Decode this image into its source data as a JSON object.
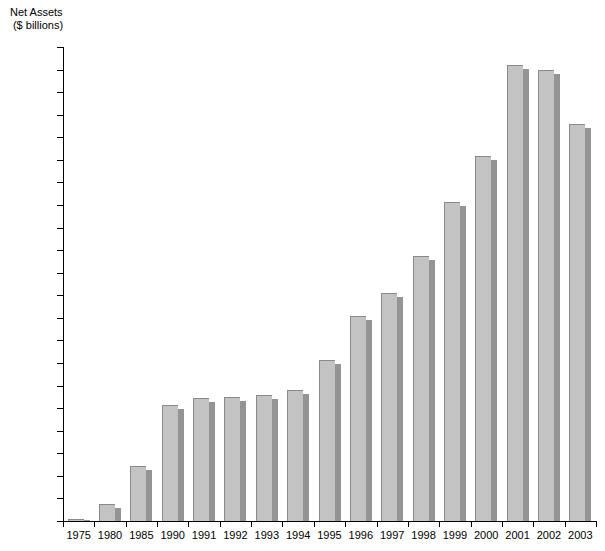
{
  "chart_data": {
    "type": "bar",
    "title": "",
    "axis_title_line1": "Net Assets",
    "axis_title_line2": "($ billions)",
    "xlabel": "",
    "ylabel": "Net Assets ($ billions)",
    "ylim": [
      0,
      2100
    ],
    "ytick_step": 100,
    "grid": false,
    "legend": "none",
    "bar_color": "#c3c3c3",
    "bar_shadow_color": "#949494",
    "axis_color": "#000000",
    "background_color": "#ffffff",
    "categories": [
      "1975",
      "1980",
      "1985",
      "1990",
      "1991",
      "1992",
      "1993",
      "1994",
      "1995",
      "1996",
      "1997",
      "1998",
      "1999",
      "2000",
      "2001",
      "2002",
      "2003"
    ],
    "values": [
      8,
      77,
      245,
      512,
      545,
      550,
      557,
      582,
      712,
      910,
      1012,
      1172,
      1415,
      1615,
      2020,
      1998,
      1760
    ],
    "yticks": [
      0,
      100,
      200,
      300,
      400,
      500,
      600,
      700,
      800,
      900,
      1000,
      1100,
      1200,
      1300,
      1400,
      1500,
      1600,
      1700,
      1800,
      1900,
      2000,
      2100
    ]
  }
}
